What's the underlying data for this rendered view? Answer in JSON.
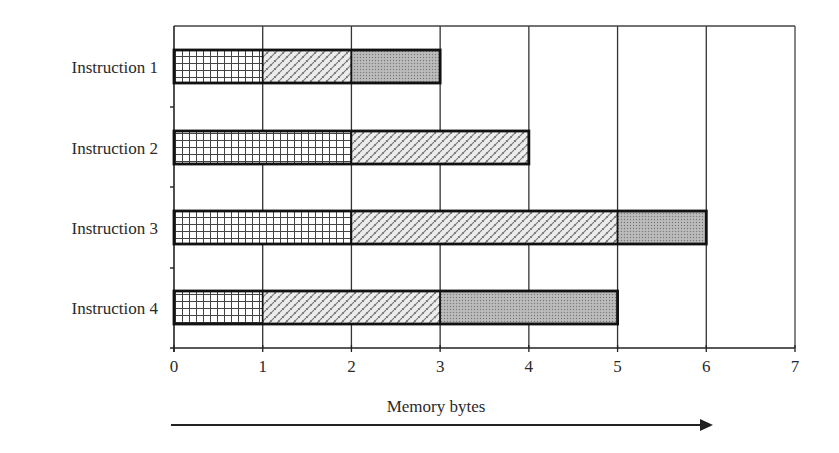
{
  "chart_data": {
    "type": "bar",
    "orientation": "horizontal",
    "stacked": true,
    "title": "",
    "xlabel": "Memory bytes",
    "ylabel": "",
    "xlim": [
      0,
      7
    ],
    "x_ticks": [
      "0",
      "1",
      "2",
      "3",
      "4",
      "5",
      "6",
      "7"
    ],
    "grid": {
      "vertical": true,
      "horizontal": false
    },
    "legend": null,
    "categories": [
      "Instruction 1",
      "Instruction 2",
      "Instruction  3",
      "Instruction  4"
    ],
    "series": [
      {
        "name": "segment-1 (grid pattern)",
        "pattern": "grid",
        "values": [
          1,
          2,
          2,
          1
        ]
      },
      {
        "name": "segment-2 (diagonal brick pattern)",
        "pattern": "brick",
        "values": [
          1,
          2,
          3,
          2
        ]
      },
      {
        "name": "segment-3 (dotted gray pattern)",
        "pattern": "dots",
        "values": [
          1,
          0,
          1,
          2
        ]
      }
    ],
    "totals": [
      3,
      4,
      6,
      5
    ],
    "annotations": [
      {
        "type": "arrow",
        "direction": "right",
        "label": "Memory bytes"
      }
    ]
  },
  "labels": {
    "rows": [
      "Instruction 1",
      "Instruction 2",
      "Instruction  3",
      "Instruction  4"
    ],
    "ticks": [
      "0",
      "1",
      "2",
      "3",
      "4",
      "5",
      "6",
      "7"
    ],
    "xlabel": "Memory bytes"
  },
  "colors": {
    "axis": "#333333",
    "bar_border": "#111111",
    "grid_fill": "#ffffff",
    "grid_line": "#444444",
    "brick_fill": "#ececec",
    "brick_line": "#6a6a6a",
    "dots_fill": "#a9a9a9"
  }
}
